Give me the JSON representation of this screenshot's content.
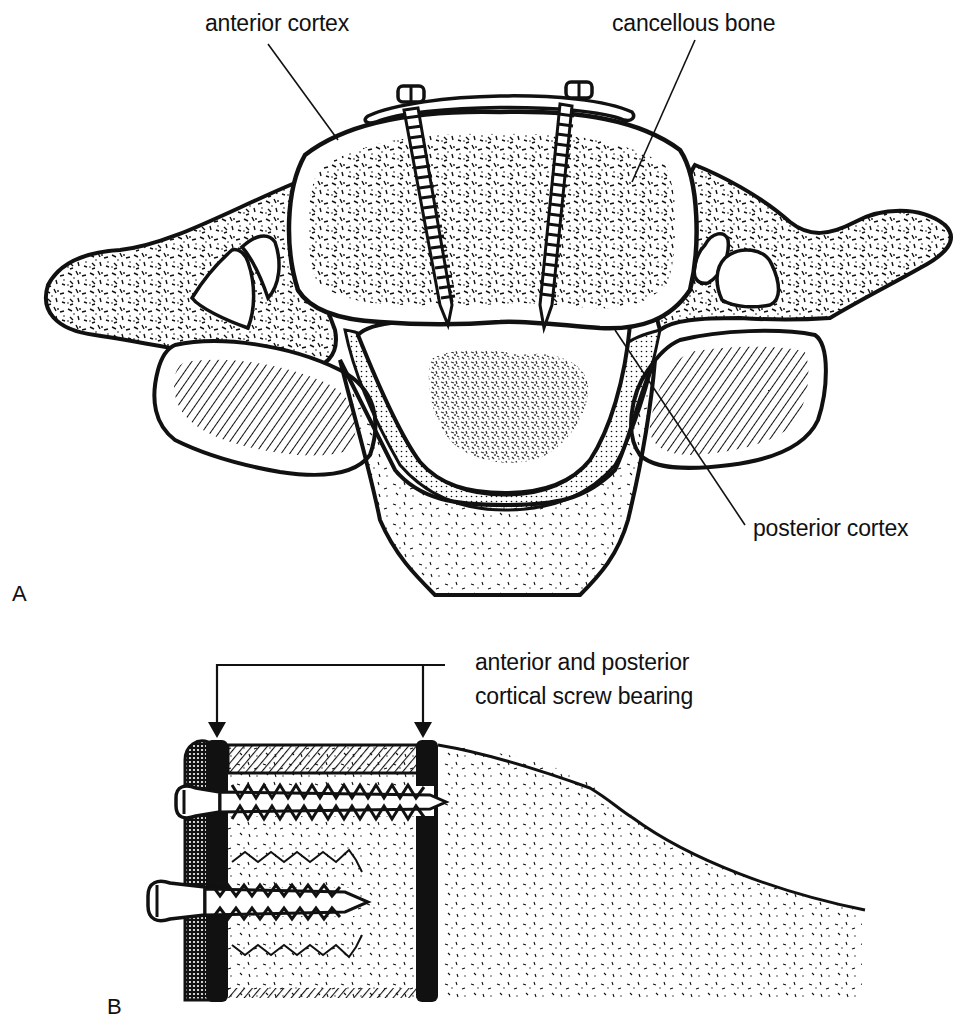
{
  "figure": {
    "panels": [
      {
        "letter": "A",
        "view": "axial cross-section of cervical vertebra with anterior plate and two screws",
        "labels": {
          "anterior_cortex": "anterior cortex",
          "cancellous_bone": "cancellous bone",
          "posterior_cortex": "posterior cortex"
        }
      },
      {
        "letter": "B",
        "view": "sagittal section of vertebral body with bicortical and unicortical screws",
        "labels": {
          "bearing_line1": "anterior and posterior",
          "bearing_line2": "cortical screw bearing"
        }
      }
    ],
    "colors": {
      "ink": "#111111",
      "paper": "#ffffff"
    }
  }
}
